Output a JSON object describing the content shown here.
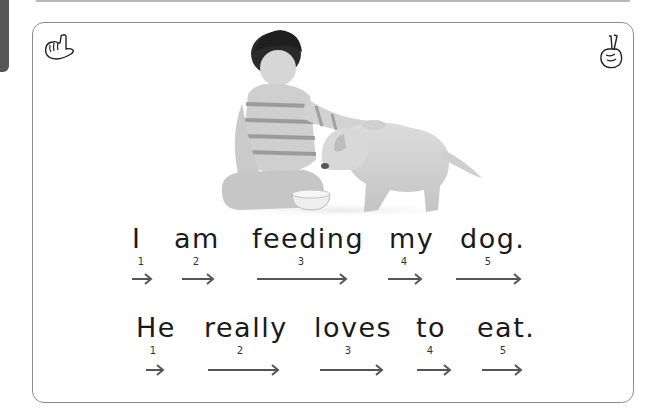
{
  "page": {
    "icons": {
      "left": "pointing-hand-icon",
      "right": "crossed-fingers-icon"
    },
    "image": {
      "description": "boy feeding puppy (grayscale photo)"
    },
    "sentences": [
      {
        "text": "I am feeding my dog.",
        "words": [
          {
            "text": "I",
            "number": "1"
          },
          {
            "text": "am",
            "number": "2"
          },
          {
            "text": "feeding",
            "number": "3"
          },
          {
            "text": "my",
            "number": "4"
          },
          {
            "text": "dog.",
            "number": "5"
          }
        ]
      },
      {
        "text": "He really loves to eat.",
        "words": [
          {
            "text": "He",
            "number": "1"
          },
          {
            "text": "really",
            "number": "2"
          },
          {
            "text": "loves",
            "number": "3"
          },
          {
            "text": "to",
            "number": "4"
          },
          {
            "text": "eat.",
            "number": "5"
          }
        ]
      }
    ],
    "colors": {
      "text": "#1a1a1a",
      "arrow": "#555555",
      "border": "#8c8c8c",
      "tab": "#555555"
    }
  }
}
